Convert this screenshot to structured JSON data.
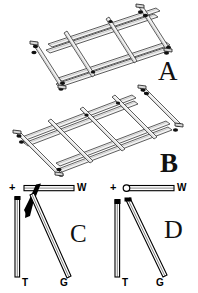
{
  "figure": {
    "type": "multi-panel-scientific-figure",
    "background_color": "#ffffff",
    "line_color": "#1a1a1a",
    "width": 198,
    "height": 293,
    "panels": [
      {
        "id": "A",
        "letter": "A",
        "letter_style": "serif-light",
        "description": "isometric rendering of a flat rectangular lattice frame built from long straight rods: two long parallel rails running lower-left to upper-right, crossed by short transverse rods lashed at their intersections",
        "long_rails": 3,
        "cross_rods": 4,
        "joint_markers": 8
      },
      {
        "id": "B",
        "letter": "B",
        "letter_style": "serif-bold",
        "description": "isometric rendering of a similar flat rectangular lattice frame viewed from the opposite diagonal, cross rods extending past the rails with lashed joints",
        "long_rails": 3,
        "cross_rods": 5,
        "joint_markers": 9
      },
      {
        "id": "C",
        "letter": "C",
        "letter_style": "serif-light",
        "description": "schematic side view: a horizontal hollow bar W at top, a vertical hollow bar T at left, a long diagonal hollow bar G going down-right, and a solid black wedge-shaped element binding them at the upper-left junction",
        "labels": [
          "+",
          "W",
          "T",
          "G"
        ],
        "has_solid_wedge": true
      },
      {
        "id": "D",
        "letter": "D",
        "letter_style": "serif-light",
        "description": "schematic side view without the solid wedge: horizontal hollow bar W with a small open circle at its left end, vertical hollow bar T at left, long diagonal hollow bar G going down-right, small solid caps at the T and G tops",
        "labels": [
          "+",
          "W",
          "T",
          "G"
        ],
        "has_solid_wedge": false
      }
    ]
  },
  "labels": {
    "panel_a": "A",
    "panel_b": "B",
    "panel_c": "C",
    "panel_d": "D",
    "plus_c": "+",
    "plus_d": "+",
    "w_c": "W",
    "w_d": "W",
    "t_c": "T",
    "t_d": "T",
    "g_c": "G",
    "g_d": "G"
  }
}
